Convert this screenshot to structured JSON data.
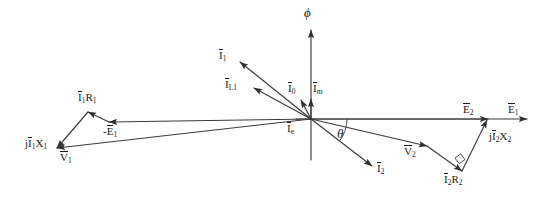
{
  "diagram": {
    "type": "phasor-diagram",
    "background_color": "#ffffff",
    "line_color": "#3a3a3a",
    "text_color": "#1a1a1a",
    "origin": {
      "x": 311,
      "y": 119
    },
    "labels": {
      "flux": "ϕ",
      "theta": "θ",
      "I1": {
        "base": "I",
        "sub": "1",
        "overbar": true,
        "prefix": ""
      },
      "IL1": {
        "base": "I",
        "sub": "L1",
        "overbar": true,
        "prefix": ""
      },
      "I0": {
        "base": "I",
        "sub": "0",
        "overbar": true,
        "prefix": ""
      },
      "Im": {
        "base": "I",
        "sub": "m",
        "overbar": true,
        "prefix": ""
      },
      "Ie": {
        "base": "I",
        "sub": "e",
        "overbar": true,
        "prefix": ""
      },
      "I2": {
        "base": "I",
        "sub": "2",
        "overbar": true,
        "prefix": ""
      },
      "E1": {
        "base": "E",
        "sub": "1",
        "overbar": true,
        "prefix": ""
      },
      "E2": {
        "base": "E",
        "sub": "2",
        "overbar": true,
        "prefix": ""
      },
      "negE1": {
        "base": "E",
        "sub": "1",
        "overbar": true,
        "prefix": "-"
      },
      "V1": {
        "base": "V",
        "sub": "1",
        "overbar": true,
        "prefix": ""
      },
      "V2": {
        "base": "V",
        "sub": "2",
        "overbar": true,
        "prefix": ""
      },
      "I1R1": {
        "base": "I",
        "sub": "1",
        "overbar": true,
        "prefix": "",
        "suffix": "R",
        "suffix_sub": "1"
      },
      "jI1X1": {
        "base": "I",
        "sub": "1",
        "overbar": true,
        "prefix": "j",
        "suffix": "X",
        "suffix_sub": "1"
      },
      "I2R2": {
        "base": "I",
        "sub": "2",
        "overbar": true,
        "prefix": "",
        "suffix": "R",
        "suffix_sub": "2"
      },
      "jI2X2": {
        "base": "I",
        "sub": "2",
        "overbar": true,
        "prefix": "j",
        "suffix": "X",
        "suffix_sub": "2"
      }
    },
    "label_text": {
      "flux": "ϕ",
      "theta": "θ",
      "I1": "Ī₁",
      "IL1": "ĪL1",
      "I0": "Ī₀",
      "Im": "Īm",
      "Ie": "Īe",
      "I2": "Ī₂",
      "E1": "Ē₁",
      "E2": "Ē₂",
      "negE1": "-Ē₁",
      "V1": "V̄₁",
      "V2": "V̄₂",
      "I1R1": "Ī₁R₁",
      "jI1X1": "jĪ₁X₁",
      "I2R2": "Ī₂R₂",
      "jI2X2": "jĪ₂X₂"
    },
    "vectors": [
      {
        "name": "flux-phasor",
        "label_key": "flux",
        "x1": 311,
        "y1": 119,
        "x2": 311,
        "y2": 30,
        "arrow": true
      },
      {
        "name": "phi-axis-lower",
        "label_key": null,
        "x1": 311,
        "y1": 119,
        "x2": 311,
        "y2": 160,
        "arrow": false
      },
      {
        "name": "E1-phasor",
        "label_key": "E1",
        "x1": 311,
        "y1": 119,
        "x2": 527,
        "y2": 119,
        "arrow": true
      },
      {
        "name": "E2-phasor",
        "label_key": "E2",
        "x1": 311,
        "y1": 119,
        "x2": 488,
        "y2": 119,
        "arrow": true
      },
      {
        "name": "negE1-phasor",
        "label_key": "negE1",
        "x1": 311,
        "y1": 119,
        "x2": 109,
        "y2": 122,
        "arrow": true
      },
      {
        "name": "I1-phasor",
        "label_key": "I1",
        "x1": 311,
        "y1": 119,
        "x2": 240,
        "y2": 62,
        "arrow": true
      },
      {
        "name": "IL1-phasor",
        "label_key": "IL1",
        "x1": 311,
        "y1": 119,
        "x2": 254,
        "y2": 88,
        "arrow": true
      },
      {
        "name": "I0-phasor",
        "label_key": "I0",
        "x1": 311,
        "y1": 119,
        "x2": 301,
        "y2": 100,
        "arrow": true
      },
      {
        "name": "Im-phasor",
        "label_key": "Im",
        "x1": 311,
        "y1": 119,
        "x2": 311,
        "y2": 99,
        "arrow": true
      },
      {
        "name": "Ie-phasor",
        "label_key": "Ie",
        "x1": 311,
        "y1": 119,
        "x2": 296,
        "y2": 119,
        "arrow": false
      },
      {
        "name": "I2-phasor",
        "label_key": "I2",
        "x1": 311,
        "y1": 119,
        "x2": 372,
        "y2": 166,
        "arrow": true
      },
      {
        "name": "V2-phasor",
        "label_key": "V2",
        "x1": 311,
        "y1": 119,
        "x2": 427,
        "y2": 146,
        "arrow": true
      },
      {
        "name": "I2R2-phasor",
        "label_key": "I2R2",
        "x1": 427,
        "y1": 146,
        "x2": 462,
        "y2": 171,
        "arrow": true
      },
      {
        "name": "jI2X2-phasor",
        "label_key": "jI2X2",
        "x1": 462,
        "y1": 171,
        "x2": 487,
        "y2": 120,
        "arrow": true
      },
      {
        "name": "V1-phasor",
        "label_key": "V1",
        "x1": 311,
        "y1": 119,
        "x2": 57,
        "y2": 148,
        "arrow": true
      },
      {
        "name": "I1R1-phasor",
        "label_key": "I1R1",
        "x1": 109,
        "y1": 122,
        "x2": 88,
        "y2": 112,
        "arrow": true
      },
      {
        "name": "jI1X1-phasor",
        "label_key": "jI1X1",
        "x1": 88,
        "y1": 112,
        "x2": 57,
        "y2": 148,
        "arrow": true
      }
    ],
    "angle_arc": {
      "name": "theta-arc",
      "cx": 311,
      "cy": 119,
      "r": 36,
      "from_deg": 0,
      "to_deg": 37
    },
    "right_angle_marker": {
      "name": "right-angle-marker",
      "x": 455,
      "y": 158,
      "size": 8
    }
  }
}
